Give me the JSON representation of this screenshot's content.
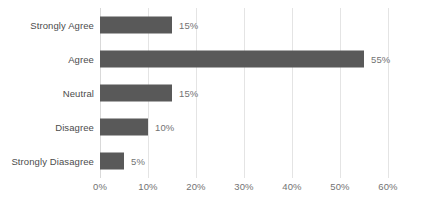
{
  "chart_data": {
    "type": "bar",
    "orientation": "horizontal",
    "title": "",
    "xlabel": "",
    "ylabel": "",
    "categories": [
      "Strongly Agree",
      "Agree",
      "Neutral",
      "Disagree",
      "Strongly Diasagree"
    ],
    "values": [
      15,
      55,
      15,
      10,
      5
    ],
    "data_labels": [
      "15%",
      "55%",
      "15%",
      "10%",
      "5%"
    ],
    "xlim": [
      0,
      60
    ],
    "xticks": [
      0,
      10,
      20,
      30,
      40,
      50,
      60
    ],
    "xtick_labels": [
      "0%",
      "10%",
      "20%",
      "30%",
      "40%",
      "50%",
      "60%"
    ],
    "grid": "vertical",
    "legend": "none",
    "series": [
      {
        "name": "",
        "values": [
          15,
          55,
          15,
          10,
          5
        ]
      }
    ],
    "colors": {
      "bar_fill": "#595959",
      "gridline": "#e4e4e4",
      "axis_line": "#d9d9d9",
      "category_text": "#4c4c4c",
      "tick_text": "#737373",
      "value_text": "#737373",
      "background": "#ffffff"
    }
  }
}
